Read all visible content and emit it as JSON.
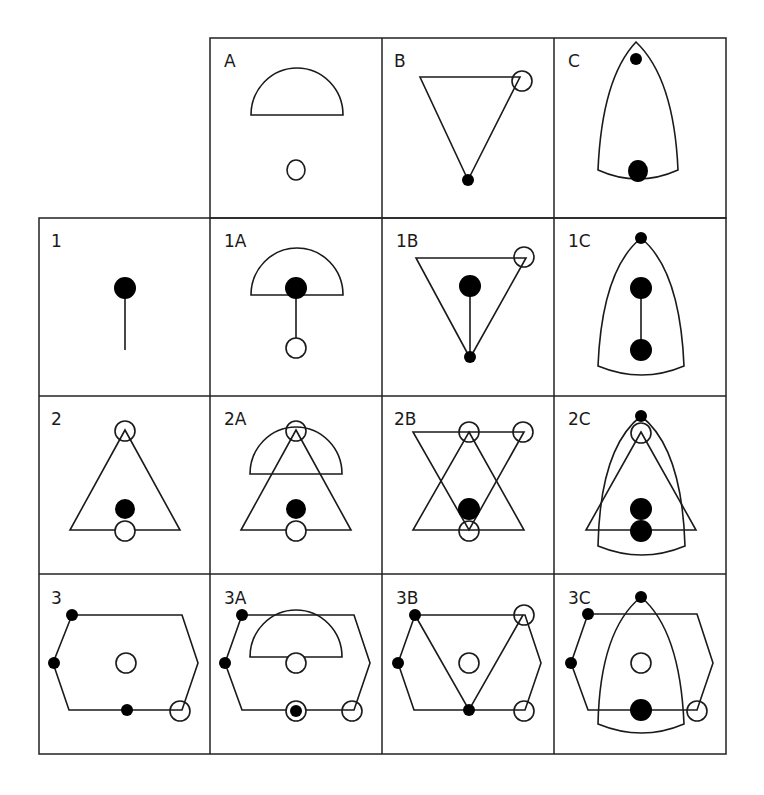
{
  "diagram": {
    "type": "combination-grid",
    "column_headers": [
      {
        "id": "A",
        "label": "A",
        "description": "semicircle with open circle below"
      },
      {
        "id": "B",
        "label": "B",
        "description": "inverted triangle, open circle at top-right vertex, filled dot at bottom vertex"
      },
      {
        "id": "C",
        "label": "C",
        "description": "bullet/arch shape with small filled dot at apex and large filled dot near base"
      }
    ],
    "row_headers": [
      {
        "id": "1",
        "label": "1",
        "description": "filled dot on vertical stem"
      },
      {
        "id": "2",
        "label": "2",
        "description": "upright triangle with open circles at apex and base midpoint, filled dot above base"
      },
      {
        "id": "3",
        "label": "3",
        "description": "hexagon with filled dots at left vertices and bottom, open circle center and bottom-right vertex"
      }
    ],
    "cells": [
      {
        "id": "1A",
        "label": "1A"
      },
      {
        "id": "1B",
        "label": "1B"
      },
      {
        "id": "1C",
        "label": "1C"
      },
      {
        "id": "2A",
        "label": "2A"
      },
      {
        "id": "2B",
        "label": "2B"
      },
      {
        "id": "2C",
        "label": "2C"
      },
      {
        "id": "3A",
        "label": "3A"
      },
      {
        "id": "3B",
        "label": "3B"
      },
      {
        "id": "3C",
        "label": "3C"
      }
    ],
    "legend": {
      "filled_circle": "filled dot",
      "open_circle": "open circle"
    },
    "colors": {
      "stroke": "#1a1a1a",
      "fill": "#000000",
      "background": "#ffffff"
    }
  }
}
